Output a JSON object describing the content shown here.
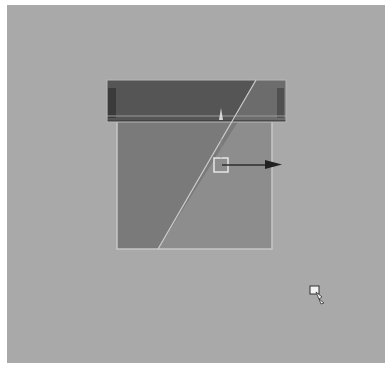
{
  "viewport": {
    "name": "3D viewport",
    "background_color": "#a9a9a9"
  },
  "object": {
    "name": "box-with-lid",
    "lid_color_dark": "#555555",
    "lid_color_light": "#6e6e6e",
    "body_color_dark": "#7b7b7b",
    "body_color_light": "#8f8f8f",
    "edge_highlight_color": "#c8c8c8"
  },
  "gizmo": {
    "type": "move-x-axis",
    "handle_color": "#e6e6e6",
    "arrow_color": "#2a2a2a"
  },
  "cursor": {
    "type": "select-cursor"
  }
}
